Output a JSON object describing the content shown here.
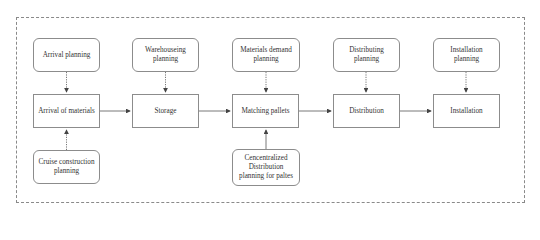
{
  "diagram": {
    "type": "flowchart",
    "planning_nodes": [
      {
        "id": "arrival-planning",
        "label": "Arrival planning"
      },
      {
        "id": "warehouseing-planning",
        "label": "Warehouseing planning"
      },
      {
        "id": "materials-demand-planning",
        "label": "Materials demand planning"
      },
      {
        "id": "distributing-planning",
        "label": "Distributing planning"
      },
      {
        "id": "installation-planning",
        "label": "Installation planning"
      }
    ],
    "process_nodes": [
      {
        "id": "arrival-of-materials",
        "label": "Arrival of materials"
      },
      {
        "id": "storage",
        "label": "Storage"
      },
      {
        "id": "matching-pallets",
        "label": "Matching pallets"
      },
      {
        "id": "distribution",
        "label": "Distribution"
      },
      {
        "id": "installation",
        "label": "Installation"
      }
    ],
    "bottom_nodes": [
      {
        "id": "cruise-construction-planning",
        "label": "Cruise construction planning"
      },
      {
        "id": "centralized-distribution-planning",
        "label": "Cencentralized Distribution planning for paltes"
      }
    ],
    "edges": [
      {
        "from": "arrival-planning",
        "to": "arrival-of-materials",
        "style": "dotted"
      },
      {
        "from": "warehouseing-planning",
        "to": "storage",
        "style": "dotted"
      },
      {
        "from": "materials-demand-planning",
        "to": "matching-pallets",
        "style": "dotted"
      },
      {
        "from": "distributing-planning",
        "to": "distribution",
        "style": "dotted"
      },
      {
        "from": "installation-planning",
        "to": "installation",
        "style": "dotted"
      },
      {
        "from": "cruise-construction-planning",
        "to": "arrival-of-materials",
        "style": "dotted"
      },
      {
        "from": "centralized-distribution-planning",
        "to": "matching-pallets",
        "style": "solid"
      },
      {
        "from": "arrival-of-materials",
        "to": "storage",
        "style": "solid"
      },
      {
        "from": "storage",
        "to": "matching-pallets",
        "style": "solid"
      },
      {
        "from": "matching-pallets",
        "to": "distribution",
        "style": "solid"
      },
      {
        "from": "distribution",
        "to": "installation",
        "style": "solid"
      }
    ],
    "colors": {
      "line": "#555555",
      "border": "#8c8c8c",
      "frame": "#8a8a8a"
    }
  }
}
